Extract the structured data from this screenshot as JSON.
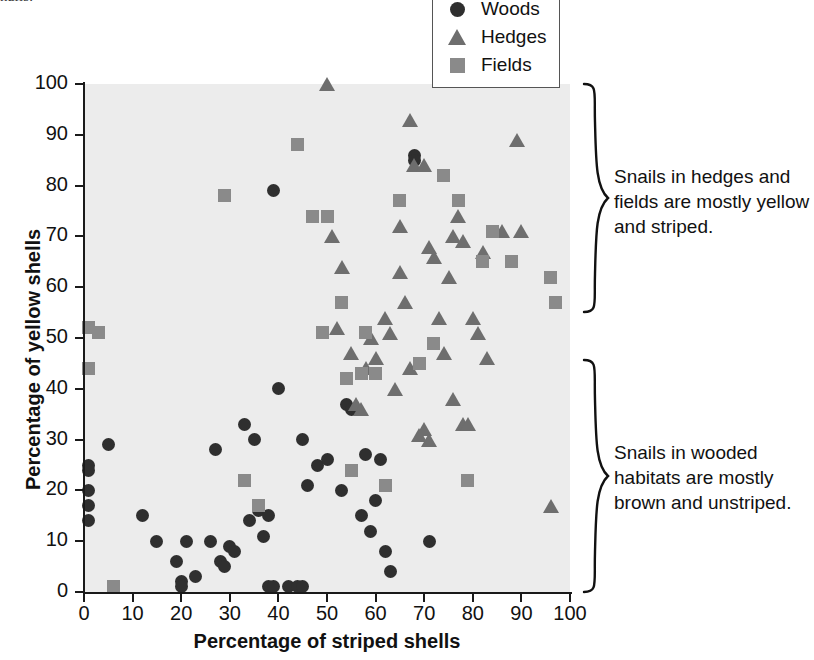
{
  "caption_fragment": "nails.",
  "axes": {
    "x_title": "Percentage of striped shells",
    "y_title": "Percentage of yellow shells",
    "x_ticks": [
      0,
      10,
      20,
      30,
      40,
      50,
      60,
      70,
      80,
      90,
      100
    ],
    "y_ticks": [
      0,
      10,
      20,
      30,
      40,
      50,
      60,
      70,
      80,
      90,
      100
    ]
  },
  "legend": {
    "items": [
      {
        "label": "Woods",
        "icon": "filled-circle-marker",
        "color": "#2f2f2f"
      },
      {
        "label": "Hedges",
        "icon": "filled-triangle-marker",
        "color": "#6e6e6e"
      },
      {
        "label": "Fields",
        "icon": "filled-square-marker",
        "color": "#8a8a8a"
      }
    ]
  },
  "annotations": [
    {
      "name": "hedges-fields-note",
      "text": "Snails in hedges and fields are mostly yellow and striped."
    },
    {
      "name": "woods-note",
      "text": "Snails in wooded habitats are mostly brown and unstriped."
    }
  ],
  "chart_data": {
    "type": "scatter",
    "title": "",
    "xlabel": "Percentage of striped shells",
    "ylabel": "Percentage of yellow shells",
    "xlim": [
      0,
      100
    ],
    "ylim": [
      0,
      100
    ],
    "grid": false,
    "plot_background": "#ececec",
    "legend_position": "top-right",
    "series": [
      {
        "name": "Woods",
        "marker": "circle",
        "color": "#2f2f2f",
        "points": [
          [
            1,
            25
          ],
          [
            1,
            24
          ],
          [
            1,
            20
          ],
          [
            1,
            17
          ],
          [
            1,
            14
          ],
          [
            5,
            29
          ],
          [
            12,
            15
          ],
          [
            15,
            10
          ],
          [
            19,
            6
          ],
          [
            20,
            2
          ],
          [
            20,
            1
          ],
          [
            21,
            10
          ],
          [
            23,
            3
          ],
          [
            26,
            10
          ],
          [
            27,
            28
          ],
          [
            28,
            6
          ],
          [
            29,
            5
          ],
          [
            30,
            9
          ],
          [
            31,
            8
          ],
          [
            33,
            33
          ],
          [
            34,
            14
          ],
          [
            35,
            30
          ],
          [
            36,
            16
          ],
          [
            37,
            11
          ],
          [
            38,
            15
          ],
          [
            38,
            1
          ],
          [
            39,
            79
          ],
          [
            39,
            1
          ],
          [
            40,
            40
          ],
          [
            42,
            1
          ],
          [
            44,
            1
          ],
          [
            45,
            1
          ],
          [
            45,
            30
          ],
          [
            46,
            21
          ],
          [
            48,
            25
          ],
          [
            50,
            26
          ],
          [
            53,
            20
          ],
          [
            54,
            37
          ],
          [
            55,
            36
          ],
          [
            57,
            15
          ],
          [
            58,
            27
          ],
          [
            59,
            12
          ],
          [
            60,
            18
          ],
          [
            61,
            26
          ],
          [
            62,
            8
          ],
          [
            63,
            4
          ],
          [
            68,
            86
          ],
          [
            68,
            85
          ],
          [
            71,
            10
          ]
        ]
      },
      {
        "name": "Hedges",
        "marker": "triangle",
        "color": "#6e6e6e",
        "points": [
          [
            50,
            100
          ],
          [
            51,
            70
          ],
          [
            52,
            52
          ],
          [
            53,
            64
          ],
          [
            55,
            47
          ],
          [
            56,
            37
          ],
          [
            57,
            36
          ],
          [
            58,
            44
          ],
          [
            59,
            50
          ],
          [
            60,
            46
          ],
          [
            62,
            54
          ],
          [
            63,
            51
          ],
          [
            64,
            40
          ],
          [
            65,
            72
          ],
          [
            65,
            63
          ],
          [
            66,
            57
          ],
          [
            67,
            93
          ],
          [
            67,
            44
          ],
          [
            68,
            84
          ],
          [
            69,
            31
          ],
          [
            70,
            32
          ],
          [
            70,
            84
          ],
          [
            71,
            68
          ],
          [
            71,
            30
          ],
          [
            72,
            66
          ],
          [
            73,
            54
          ],
          [
            74,
            47
          ],
          [
            75,
            62
          ],
          [
            76,
            70
          ],
          [
            76,
            38
          ],
          [
            77,
            74
          ],
          [
            78,
            69
          ],
          [
            78,
            33
          ],
          [
            79,
            33
          ],
          [
            80,
            54
          ],
          [
            81,
            51
          ],
          [
            82,
            67
          ],
          [
            83,
            46
          ],
          [
            86,
            71
          ],
          [
            89,
            89
          ],
          [
            90,
            71
          ],
          [
            96,
            17
          ]
        ]
      },
      {
        "name": "Fields",
        "marker": "square",
        "color": "#8a8a8a",
        "points": [
          [
            1,
            52
          ],
          [
            1,
            44
          ],
          [
            3,
            51
          ],
          [
            6,
            1
          ],
          [
            29,
            78
          ],
          [
            33,
            22
          ],
          [
            36,
            17
          ],
          [
            44,
            88
          ],
          [
            47,
            74
          ],
          [
            49,
            51
          ],
          [
            50,
            74
          ],
          [
            53,
            57
          ],
          [
            54,
            42
          ],
          [
            55,
            24
          ],
          [
            57,
            43
          ],
          [
            58,
            51
          ],
          [
            60,
            43
          ],
          [
            62,
            21
          ],
          [
            65,
            77
          ],
          [
            69,
            45
          ],
          [
            72,
            49
          ],
          [
            74,
            82
          ],
          [
            77,
            77
          ],
          [
            79,
            22
          ],
          [
            82,
            65
          ],
          [
            84,
            71
          ],
          [
            88,
            65
          ],
          [
            96,
            62
          ],
          [
            97,
            57
          ]
        ]
      }
    ]
  }
}
